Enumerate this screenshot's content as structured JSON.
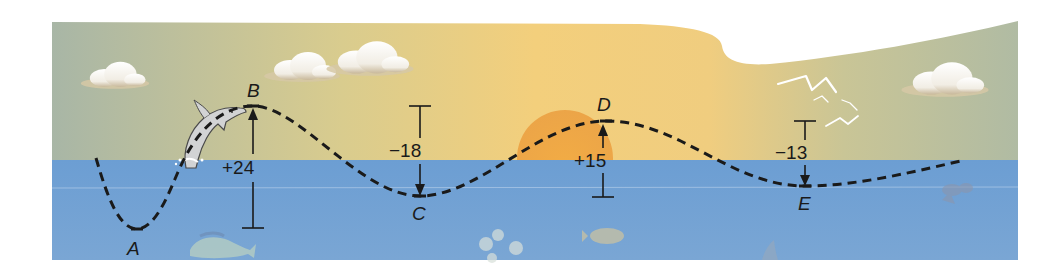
{
  "diagram": {
    "colors": {
      "sky_left": "#a9b7a6",
      "sky_center": "#f2cf7e",
      "sky_right": "#b3bca2",
      "sun": "#eda13c",
      "sea": "#6e9fd2",
      "path": "#1a1a1a",
      "text": "#1a1a1a"
    },
    "points": [
      {
        "label": "A",
        "x": 137,
        "y": 229
      },
      {
        "label": "B",
        "x": 253,
        "y": 106
      },
      {
        "label": "C",
        "x": 420,
        "y": 196
      },
      {
        "label": "D",
        "x": 606,
        "y": 121
      },
      {
        "label": "E",
        "x": 805,
        "y": 186
      }
    ],
    "changes": [
      {
        "from": "A",
        "to": "B",
        "value": "+24",
        "direction": "up"
      },
      {
        "from": "B",
        "to": "C",
        "value": "−18",
        "direction": "down"
      },
      {
        "from": "C",
        "to": "D",
        "value": "+15",
        "direction": "up"
      },
      {
        "from": "D",
        "to": "E",
        "value": "−13",
        "direction": "down"
      }
    ],
    "decorations": [
      "cloud",
      "cloud",
      "cloud",
      "cloud",
      "sun",
      "seagulls",
      "dolphin",
      "fish",
      "fish",
      "jellyfish",
      "shark-fin",
      "crab"
    ]
  }
}
